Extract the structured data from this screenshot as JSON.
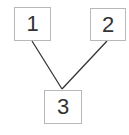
{
  "diagram": {
    "type": "tree",
    "nodes": [
      {
        "id": "n1",
        "label": "1"
      },
      {
        "id": "n2",
        "label": "2"
      },
      {
        "id": "n3",
        "label": "3"
      }
    ],
    "edges": [
      {
        "from": "n1",
        "to": "n3"
      },
      {
        "from": "n2",
        "to": "n3"
      }
    ],
    "colors": {
      "border": "#b8b8b8",
      "edge": "#333333",
      "text": "#333333"
    }
  }
}
